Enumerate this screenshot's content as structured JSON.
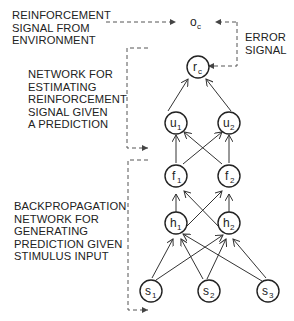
{
  "labels": {
    "reinforcement_signal": "REINFORCEMENT\nSIGNAL FROM\nENVIRONMENT",
    "error_signal": "ERROR\nSIGNAL",
    "estimating_network": "NETWORK FOR\nESTIMATING\nREINFORCEMENT\nSIGNAL GIVEN\nA PREDICTION",
    "backprop_network": "BACKPROPAGATION\nNETWORK FOR\nGENERATING\nPREDICTION GIVEN\nSTIMULUS INPUT"
  },
  "nodes": {
    "oc": {
      "main": "o",
      "sub": "c"
    },
    "rc": {
      "main": "r",
      "sub": "c"
    },
    "u1": {
      "main": "u",
      "sub": "1"
    },
    "u2": {
      "main": "u",
      "sub": "2"
    },
    "f1": {
      "main": "f",
      "sub": "1"
    },
    "f2": {
      "main": "f",
      "sub": "2"
    },
    "h1": {
      "main": "h",
      "sub": "1"
    },
    "h2": {
      "main": "h",
      "sub": "2"
    },
    "s1": {
      "main": "s",
      "sub": "1"
    },
    "s2": {
      "main": "s",
      "sub": "2"
    },
    "s3": {
      "main": "s",
      "sub": "3"
    }
  },
  "colors": {
    "ink": "#222222",
    "dashed": "#555555"
  }
}
